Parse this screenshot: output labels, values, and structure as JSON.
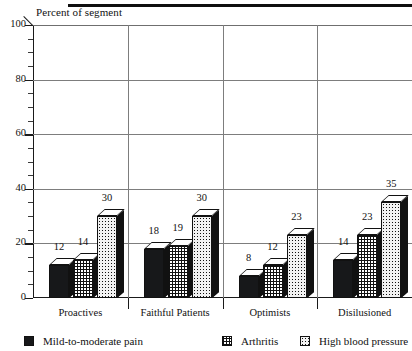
{
  "chart_data": {
    "type": "bar",
    "title": "",
    "ylabel": "Percent of segment",
    "xlabel": "",
    "ylim": [
      0,
      100
    ],
    "yticks": [
      0,
      20,
      40,
      60,
      80,
      100
    ],
    "minor_tick_step": 5,
    "grid": true,
    "legend_position": "bottom",
    "style": "3d-grouped-bar",
    "categories": [
      "Proactives",
      "Faithful Patients",
      "Optimists",
      "Disillusioned"
    ],
    "series": [
      {
        "name": "Mild-to-moderate pain",
        "fill": "solid-black",
        "values": [
          12,
          18,
          8,
          14
        ]
      },
      {
        "name": "Arthritis",
        "fill": "crosshatch-grid",
        "values": [
          14,
          19,
          12,
          23
        ]
      },
      {
        "name": "High blood pressure",
        "fill": "dotted-stipple",
        "values": [
          30,
          30,
          23,
          35
        ]
      }
    ]
  },
  "axis": {
    "title": "Percent of segment",
    "tick_labels": [
      "100",
      "80",
      "60",
      "40",
      "20",
      "0"
    ]
  },
  "categories": [
    {
      "label": "Proactives"
    },
    {
      "label": "Faithful Patients"
    },
    {
      "label": "Optimists"
    },
    {
      "label": "Disilusioned"
    }
  ],
  "bars": [
    {
      "value": "12"
    },
    {
      "value": "14"
    },
    {
      "value": "30"
    },
    {
      "value": "18"
    },
    {
      "value": "19"
    },
    {
      "value": "30"
    },
    {
      "value": "8"
    },
    {
      "value": "12"
    },
    {
      "value": "23"
    },
    {
      "value": "14"
    },
    {
      "value": "23"
    },
    {
      "value": "35"
    }
  ],
  "legend": [
    {
      "label": "Mild-to-moderate pain",
      "swatch": "solid-swatch-icon"
    },
    {
      "label": "Arthritis",
      "swatch": "grid-swatch-icon"
    },
    {
      "label": "High blood pressure",
      "swatch": "dotted-swatch-icon"
    }
  ],
  "colors": {
    "ink": "#111111",
    "grid": "#7d7d7d",
    "series_solid": "#17181a",
    "series_grid": "#ffffff",
    "series_dot": "#f2f2f2"
  }
}
